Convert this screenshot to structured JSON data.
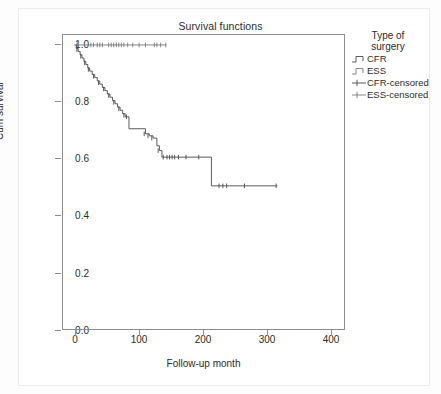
{
  "figure": {
    "title": "Survival functions"
  },
  "axes": {
    "x": {
      "label": "Follow-up month",
      "ticks": [
        "0",
        "100",
        "200",
        "300",
        "400"
      ],
      "tick_values": [
        0,
        100,
        200,
        300,
        400
      ],
      "range": [
        -18,
        425
      ]
    },
    "y": {
      "label": "Cum survival",
      "ticks": [
        "1.0",
        "0.8",
        "0.6",
        "0.4",
        "0.2",
        "0.0"
      ],
      "tick_values": [
        1.0,
        0.8,
        0.6,
        0.4,
        0.2,
        0.0
      ],
      "range": [
        0.0,
        1.035
      ]
    }
  },
  "legend": {
    "title_line1": "Type of",
    "title_line2": "surgery",
    "items": [
      {
        "label": "CFR",
        "marker": "step-line",
        "color": "#4a4a4a"
      },
      {
        "label": "ESS",
        "marker": "step-line",
        "color": "#7a7a7a"
      },
      {
        "label": "CFR-censored",
        "marker": "plus-line",
        "color": "#4a4a4a"
      },
      {
        "label": "ESS-censored",
        "marker": "plus-line",
        "color": "#7a7a7a"
      }
    ]
  },
  "chart_data": {
    "type": "line",
    "subtype": "kaplan-meier-step",
    "title": "Survival functions",
    "xlabel": "Follow-up month",
    "ylabel": "Cum survival",
    "xlim": [
      -18,
      425
    ],
    "ylim": [
      0.0,
      1.035
    ],
    "grid": false,
    "legend_position": "right",
    "series": [
      {
        "name": "ESS",
        "color": "#7a7a7a",
        "step": "post",
        "points": [
          [
            2,
            1.0
          ],
          [
            145,
            1.0
          ]
        ],
        "censored": [
          [
            4,
            1.0
          ],
          [
            6,
            1.0
          ],
          [
            26,
            1.0
          ],
          [
            30,
            1.0
          ],
          [
            36,
            1.0
          ],
          [
            40,
            1.0
          ],
          [
            44,
            1.0
          ],
          [
            54,
            1.0
          ],
          [
            58,
            1.0
          ],
          [
            62,
            1.0
          ],
          [
            66,
            1.0
          ],
          [
            70,
            1.0
          ],
          [
            74,
            1.0
          ],
          [
            78,
            1.0
          ],
          [
            84,
            1.0
          ],
          [
            92,
            1.0
          ],
          [
            102,
            1.0
          ],
          [
            112,
            1.0
          ],
          [
            126,
            1.0
          ],
          [
            130,
            1.0
          ],
          [
            136,
            1.0
          ],
          [
            144,
            1.0
          ]
        ]
      },
      {
        "name": "CFR",
        "color": "#4a4a4a",
        "step": "post",
        "points": [
          [
            0,
            1.0
          ],
          [
            3,
            0.988
          ],
          [
            6,
            0.977
          ],
          [
            9,
            0.965
          ],
          [
            12,
            0.954
          ],
          [
            15,
            0.942
          ],
          [
            18,
            0.931
          ],
          [
            21,
            0.919
          ],
          [
            24,
            0.908
          ],
          [
            28,
            0.896
          ],
          [
            32,
            0.885
          ],
          [
            36,
            0.873
          ],
          [
            40,
            0.862
          ],
          [
            44,
            0.85
          ],
          [
            48,
            0.839
          ],
          [
            52,
            0.827
          ],
          [
            56,
            0.816
          ],
          [
            60,
            0.804
          ],
          [
            64,
            0.793
          ],
          [
            68,
            0.781
          ],
          [
            72,
            0.77
          ],
          [
            76,
            0.758
          ],
          [
            80,
            0.747
          ],
          [
            84,
            0.747
          ],
          [
            86,
            0.705
          ],
          [
            108,
            0.705
          ],
          [
            112,
            0.687
          ],
          [
            118,
            0.68
          ],
          [
            124,
            0.672
          ],
          [
            130,
            0.645
          ],
          [
            134,
            0.628
          ],
          [
            138,
            0.605
          ],
          [
            215,
            0.605
          ],
          [
            216,
            0.504
          ],
          [
            320,
            0.504
          ]
        ],
        "censored": [
          [
            4,
            0.983
          ],
          [
            10,
            0.96
          ],
          [
            16,
            0.937
          ],
          [
            22,
            0.914
          ],
          [
            30,
            0.89
          ],
          [
            38,
            0.867
          ],
          [
            46,
            0.845
          ],
          [
            54,
            0.822
          ],
          [
            62,
            0.798
          ],
          [
            70,
            0.775
          ],
          [
            78,
            0.752
          ],
          [
            82,
            0.747
          ],
          [
            110,
            0.687
          ],
          [
            116,
            0.68
          ],
          [
            122,
            0.672
          ],
          [
            132,
            0.628
          ],
          [
            140,
            0.605
          ],
          [
            146,
            0.605
          ],
          [
            150,
            0.605
          ],
          [
            154,
            0.605
          ],
          [
            158,
            0.605
          ],
          [
            164,
            0.605
          ],
          [
            176,
            0.605
          ],
          [
            196,
            0.605
          ],
          [
            228,
            0.504
          ],
          [
            234,
            0.504
          ],
          [
            240,
            0.504
          ],
          [
            268,
            0.504
          ],
          [
            318,
            0.504
          ]
        ]
      }
    ]
  }
}
